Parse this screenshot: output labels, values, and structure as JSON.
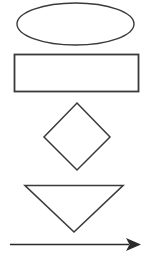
{
  "document": {
    "title": "Flowchart Shapes",
    "background_color": "#ffffff",
    "width": 151,
    "height": 259,
    "description": "Five basic flowchart shape outlines stacked vertically on a white background"
  },
  "palette": {
    "stroke_color": "#3a3a3a",
    "stroke_color_dark": "#2b2b2b",
    "fill_color": "none",
    "background_color": "#ffffff"
  },
  "shapes": [
    {
      "id": "ellipse",
      "name": "Ellipse",
      "type": "ellipse",
      "cx": 75.5,
      "cy": 24,
      "rx": 58.5,
      "ry": 21,
      "stroke_width": 1.4,
      "fill": "none"
    },
    {
      "id": "rectangle",
      "name": "Rectangle",
      "type": "rect",
      "x": 14.5,
      "y": 54.5,
      "width": 124,
      "height": 37,
      "stroke_width": 1.8,
      "fill": "none"
    },
    {
      "id": "diamond",
      "name": "Diamond",
      "type": "polygon",
      "points": "77,103 110,137 77,170 44,137",
      "stroke_width": 1.5,
      "fill": "none"
    },
    {
      "id": "triangle",
      "name": "Inverted Triangle",
      "type": "polygon",
      "points": "25,185.5 123,185.5 74,232",
      "stroke_width": 1.6,
      "fill": "none"
    },
    {
      "id": "arrow",
      "name": "Right Arrow",
      "type": "arrow",
      "x1": 10,
      "y1": 244.5,
      "x2": 129,
      "y2": 244.5,
      "stroke_width": 1.5,
      "head_points": "141,244.5 126,238 129.5,244.5 126,251",
      "fill": "#2b2b2b"
    }
  ]
}
